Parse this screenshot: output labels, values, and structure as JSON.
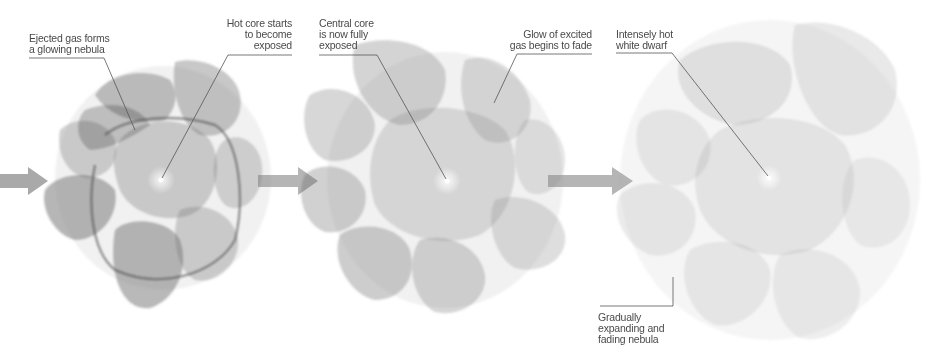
{
  "diagram": {
    "title": "",
    "stages": [
      {
        "id": "stage-1",
        "center": [
          161,
          178
        ],
        "shade": "#555555",
        "opacity": 0.3,
        "labels": [
          {
            "text": "Ejected gas forms\na glowing nebula",
            "align": "left"
          },
          {
            "text": "Hot core starts\nto become\nexposed",
            "align": "right"
          }
        ]
      },
      {
        "id": "stage-2",
        "center": [
          447,
          181
        ],
        "shade": "#6a6a6a",
        "opacity": 0.22,
        "labels": [
          {
            "text": "Central core\nis now fully\nexposed",
            "align": "left"
          },
          {
            "text": "Glow of excited\ngas begins to fade",
            "align": "right"
          }
        ]
      },
      {
        "id": "stage-3",
        "center": [
          769,
          178
        ],
        "shade": "#8a8a8a",
        "opacity": 0.16,
        "labels": [
          {
            "text": "Intensely hot\nwhite dwarf",
            "align": "left"
          },
          {
            "text": "Gradually\nexpanding and\nfading nebula",
            "align": "left"
          }
        ]
      }
    ],
    "arrows": [
      {
        "id": "arrow-in",
        "x": 0,
        "y": 181
      },
      {
        "id": "arrow-1-2",
        "x": 258,
        "y": 181
      },
      {
        "id": "arrow-2-3",
        "x": 548,
        "y": 181
      }
    ],
    "colors": {
      "background": "#ffffff",
      "arrow": "#9c9c9c",
      "leader_line": "#555555",
      "text": "#4a4a4a"
    }
  }
}
